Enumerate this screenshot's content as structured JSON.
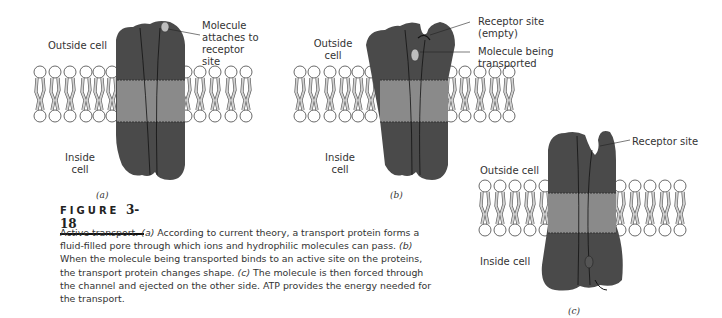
{
  "figure": {
    "label_word": "FIGURE",
    "label_number": "3-18",
    "caption_parts": [
      {
        "text": "Active transport. ",
        "italic": false
      },
      {
        "text": "(a)",
        "italic": true
      },
      {
        "text": " According to current theory, a transport protein forms a fluid-filled pore through which ions and hydrophilic molecules can pass. ",
        "italic": false
      },
      {
        "text": "(b)",
        "italic": true
      },
      {
        "text": " When the molecule being transported binds to an active site on the proteins, the transport protein changes shape. ",
        "italic": false
      },
      {
        "text": "(c)",
        "italic": true
      },
      {
        "text": " The molecule is then forced through the channel and ejected on the other side. ATP provides the energy needed for the transport.",
        "italic": false
      }
    ]
  },
  "panels": {
    "a": {
      "tag": "(a)",
      "outside_label": "Outside cell",
      "inside_label": "Inside cell",
      "annotation": "Molecule attaches to receptor site"
    },
    "b": {
      "tag": "(b)",
      "outside_label": "Outside cell",
      "inside_label": "Inside cell",
      "annotation_1": "Receptor site (empty)",
      "annotation_2": "Molecule being transported"
    },
    "c": {
      "tag": "(c)",
      "outside_label": "Outside cell",
      "inside_label": "Inside cell",
      "annotation": "Receptor site"
    }
  },
  "colors": {
    "protein": "#4a4a4a",
    "membrane_band": "#8a8a8a",
    "lipid_tail": "#cfcfcf",
    "molecule": "#bdbdbd"
  }
}
